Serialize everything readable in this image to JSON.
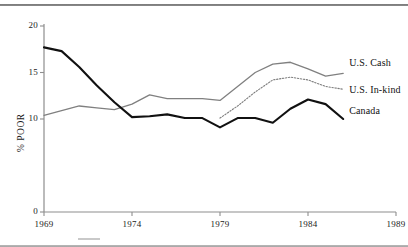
{
  "chart_data": {
    "type": "line",
    "title": "",
    "xlabel": "",
    "ylabel": "% POOR",
    "xlim": [
      1969,
      1989
    ],
    "ylim": [
      0,
      20
    ],
    "grid": false,
    "legend_position": "right-inline-labels",
    "xticks": [
      "1969",
      "1974",
      "1979",
      "1984",
      "1989"
    ],
    "xtick_values": [
      1969,
      1974,
      1979,
      1984,
      1989
    ],
    "yticks": [
      "0",
      "10",
      "15",
      "20"
    ],
    "ytick_values": [
      0,
      10,
      15,
      20
    ],
    "x": [
      1969,
      1970,
      1971,
      1972,
      1973,
      1974,
      1975,
      1976,
      1977,
      1978,
      1979,
      1980,
      1981,
      1982,
      1983,
      1984,
      1985,
      1986
    ],
    "series": [
      {
        "name": "U.S. Cash",
        "label": "U.S. Cash",
        "style": "solid",
        "color": "#808080",
        "width": 1.3,
        "x": [
          1969,
          1970,
          1971,
          1972,
          1973,
          1974,
          1975,
          1976,
          1977,
          1978,
          1979,
          1980,
          1981,
          1982,
          1983,
          1984,
          1985,
          1986
        ],
        "values": [
          10.4,
          10.9,
          11.4,
          11.2,
          11.0,
          11.6,
          12.6,
          12.2,
          12.2,
          12.2,
          12.0,
          13.5,
          15.0,
          15.9,
          16.1,
          15.4,
          14.6,
          14.9
        ]
      },
      {
        "name": "U.S. In-kind",
        "label": "U.S. In-kind",
        "style": "dotted",
        "color": "#7d7d7d",
        "width": 1.1,
        "x": [
          1979,
          1980,
          1981,
          1982,
          1983,
          1984,
          1985,
          1986
        ],
        "values": [
          10.1,
          11.4,
          12.9,
          14.2,
          14.5,
          14.2,
          13.5,
          13.2
        ]
      },
      {
        "name": "Canada",
        "label": "Canada",
        "style": "solid",
        "color": "#111111",
        "width": 2.1,
        "x": [
          1969,
          1970,
          1971,
          1972,
          1973,
          1974,
          1975,
          1976,
          1977,
          1978,
          1979,
          1980,
          1981,
          1982,
          1983,
          1984,
          1985,
          1986
        ],
        "values": [
          17.7,
          17.3,
          15.6,
          13.6,
          11.8,
          10.2,
          10.3,
          10.5,
          10.1,
          10.1,
          9.1,
          10.1,
          10.1,
          9.6,
          11.1,
          12.1,
          11.6,
          10.0
        ]
      }
    ],
    "annotations": [
      {
        "text": "U.S. Cash",
        "series": "U.S. Cash"
      },
      {
        "text": "U.S. In-kind",
        "series": "U.S. In-kind"
      },
      {
        "text": "Canada",
        "series": "Canada"
      }
    ]
  },
  "axis": {
    "y_title": "% POOR"
  }
}
